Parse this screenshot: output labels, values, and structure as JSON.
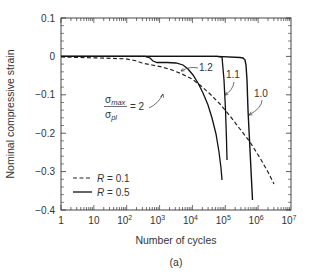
{
  "figure_label": "(a)",
  "chart_data": {
    "type": "line",
    "title": "",
    "xlabel": "Number of cycles",
    "ylabel": "Nominal compressive strain",
    "xscale": "log",
    "xlim": [
      1,
      10000000
    ],
    "ylim": [
      -0.4,
      0.1
    ],
    "x_tick_labels": [
      "1",
      "10",
      "10^2",
      "10^3",
      "10^4",
      "10^5",
      "10^6",
      "10^7"
    ],
    "y_tick_labels": [
      "0.1",
      "0",
      "-0.1",
      "-0.2",
      "-0.3",
      "-0.4"
    ],
    "grid": false,
    "legend": {
      "position": "lower left",
      "entries": [
        {
          "label": "R = 0.1",
          "style": "dashed"
        },
        {
          "label": "R = 0.5",
          "style": "solid"
        }
      ]
    },
    "series": [
      {
        "name": "R = 0.1, σmax/σpl = 2",
        "style": "dashed",
        "x": [
          1,
          10,
          100,
          300,
          1000,
          3000,
          10000,
          30000,
          100000,
          300000,
          1000000,
          2000000
        ],
        "y": [
          0,
          -0.003,
          -0.006,
          -0.015,
          -0.035,
          -0.05,
          -0.07,
          -0.1,
          -0.15,
          -0.2,
          -0.26,
          -0.29
        ]
      },
      {
        "name": "R = 0.5, σmax/σpl = 1.2",
        "style": "solid",
        "x": [
          1,
          100,
          500,
          1000,
          3000,
          10000,
          20000,
          40000,
          60000,
          80000
        ],
        "y": [
          0,
          0,
          -0.003,
          -0.015,
          -0.02,
          -0.03,
          -0.06,
          -0.12,
          -0.2,
          -0.29
        ]
      },
      {
        "name": "R = 0.5, σmax/σpl = 1.1",
        "style": "solid",
        "x": [
          1,
          10000,
          90000,
          100000,
          110000
        ],
        "y": [
          0,
          0,
          -0.002,
          -0.1,
          -0.23
        ]
      },
      {
        "name": "R = 0.5, σmax/σpl = 1.0",
        "style": "solid",
        "x": [
          1,
          100000,
          500000,
          600000,
          650000,
          700000
        ],
        "y": [
          0,
          0,
          -0.003,
          -0.03,
          -0.2,
          -0.38
        ]
      }
    ],
    "annotations": [
      {
        "text": "σmax/σpl = 2",
        "target_series": "R = 0.1"
      },
      {
        "text": "1.2",
        "target_series": "R = 0.5, σmax/σpl = 1.2"
      },
      {
        "text": "1.1",
        "target_series": "R = 0.5, σmax/σpl = 1.1"
      },
      {
        "text": "1.0",
        "target_series": "R = 0.5, σmax/σpl = 1.0"
      }
    ]
  },
  "labels": {
    "y_ticks": [
      "0.1",
      "0",
      "−0.1",
      "−0.2",
      "−0.3",
      "−0.4"
    ],
    "x_ticks_base": [
      "1",
      "10",
      "10",
      "10",
      "10",
      "10",
      "10",
      "10"
    ],
    "x_ticks_exp": [
      "",
      "",
      "2",
      "3",
      "4",
      "5",
      "6",
      "7"
    ],
    "xlabel": "Number of cycles",
    "ylabel": "Nominal compressive strain",
    "legend_dashed": "R = 0.1",
    "legend_solid": "R = 0.5",
    "legend_R": "R",
    "legend_dashed_val": " = 0.1",
    "legend_solid_val": " = 0.5",
    "anno_sigma_num": "σ",
    "anno_sigma_num_sub": "max",
    "anno_sigma_den": "σ",
    "anno_sigma_den_sub": "pl",
    "anno_eq": "= 2",
    "anno_12": "1.2",
    "anno_11": "1.1",
    "anno_10": "1.0",
    "figure_label": "(a)"
  }
}
